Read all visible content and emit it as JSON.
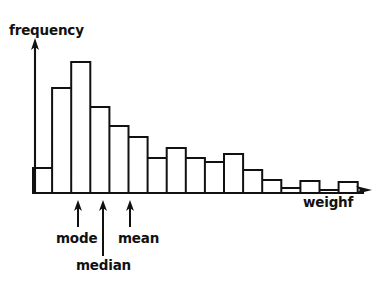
{
  "figure": {
    "title": "",
    "background_color": "#ffffff",
    "ink_color": "#111111",
    "width": 386,
    "height": 290
  },
  "labels": {
    "y_axis": "frequency",
    "x_axis": "weighf",
    "mode": "mode",
    "mean": "mean",
    "median": "median"
  },
  "annotations": [
    {
      "name": "mode",
      "label": "mode",
      "x_px": 78,
      "arrow_tip_y": 200,
      "arrow_base_y": 226
    },
    {
      "name": "median",
      "label": "median",
      "x_px": 103,
      "arrow_tip_y": 200,
      "arrow_base_y": 255
    },
    {
      "name": "mean",
      "label": "mean",
      "x_px": 130,
      "arrow_tip_y": 200,
      "arrow_base_y": 226
    }
  ],
  "chart_data": {
    "type": "bar",
    "title": "",
    "xlabel": "weighf",
    "ylabel": "frequency",
    "grid": false,
    "legend": "none",
    "axis_style": "arrow-axes",
    "bar_fill": "none",
    "bar_stroke": "#111111",
    "note": "Right-skewed histogram of weight; mode < median < mean marked by arrows below the axis.",
    "categories": [
      "1",
      "2",
      "3",
      "4",
      "5",
      "6",
      "7",
      "8",
      "9",
      "10",
      "11",
      "12",
      "13",
      "14",
      "15",
      "16",
      "17"
    ],
    "values": [
      25,
      105,
      131,
      86,
      67,
      56,
      35,
      45,
      35,
      31,
      39,
      23,
      13,
      5,
      12,
      3,
      11
    ],
    "xlim": [
      0,
      17
    ],
    "ylim": [
      0,
      140
    ],
    "baseline_y_px": 193,
    "bar_left_px": 33,
    "bar_width_px": 19.1,
    "y_axis_x_px": 35,
    "y_axis_top_px": 40,
    "x_axis_right_px": 372
  }
}
